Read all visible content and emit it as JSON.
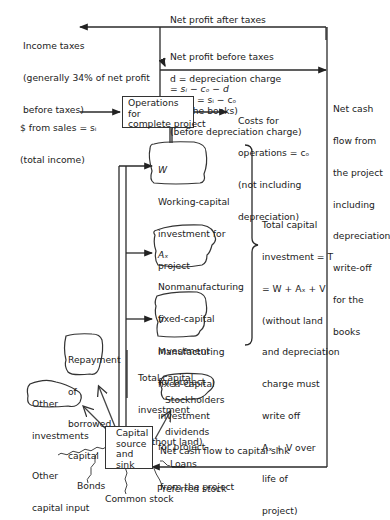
{
  "diagram": {
    "flows": {
      "net_profit_after_taxes": "Net profit after taxes",
      "income_taxes": [
        "Income taxes",
        "(generally 34% of net profit",
        "before taxes)"
      ],
      "net_profit_before_taxes": [
        "Net profit before taxes",
        "= sᵢ − cₒ − d"
      ],
      "depreciation": [
        "d = depreciation charge",
        "(for the books)"
      ],
      "profit": [
        "Profit = sᵢ − cₒ",
        "(before depreciation charge)"
      ],
      "sales": [
        "$ from sales = sᵢ",
        "(total income)"
      ],
      "costs": [
        "Costs for",
        "operations = cₒ",
        "(not including",
        "depreciation)"
      ],
      "net_cash_flow_project": [
        "Net cash",
        "flow from",
        "the project",
        "including",
        "depreciation",
        "write-off",
        "for the",
        "books"
      ],
      "total_capital_investment": [
        "Total capital",
        "investment = T",
        "= W + Aₓ + V",
        "(without land",
        "and depreciation",
        "charge must",
        "write off",
        "Aₓ + V over",
        "life of",
        "project)"
      ],
      "total_capital_investment_no_land": [
        "Total capital",
        "investment",
        "(without land)"
      ],
      "net_cash_flow_sink": [
        "Net cash flow to capital sink",
        "from the project"
      ]
    },
    "boxes": {
      "operations": [
        "Operations",
        "for",
        "complete project"
      ],
      "capital_source": [
        "Capital",
        "source",
        "and",
        "sink"
      ]
    },
    "clouds": {
      "working_capital": [
        "W",
        "Working-capital",
        "investment for",
        "project"
      ],
      "nonmanufacturing": [
        "Aₓ",
        "Nonmanufacturing",
        "fixed-capital",
        "investment",
        "for project"
      ],
      "manufacturing": [
        "V",
        "Manufacturing",
        "fixed-capital",
        "investment",
        "for project"
      ],
      "repayment": [
        "Repayment",
        "of",
        "borrowed",
        "capital"
      ],
      "other_investments": [
        "Other",
        "investments"
      ],
      "dividends": [
        "Stockholders",
        "dividends"
      ]
    },
    "inputs": {
      "other_capital_input": [
        "Other",
        "capital input"
      ],
      "bonds": "Bonds",
      "common_stock": "Common stock",
      "preferred_stock": "Preferred stock",
      "loans": "Loans"
    }
  }
}
